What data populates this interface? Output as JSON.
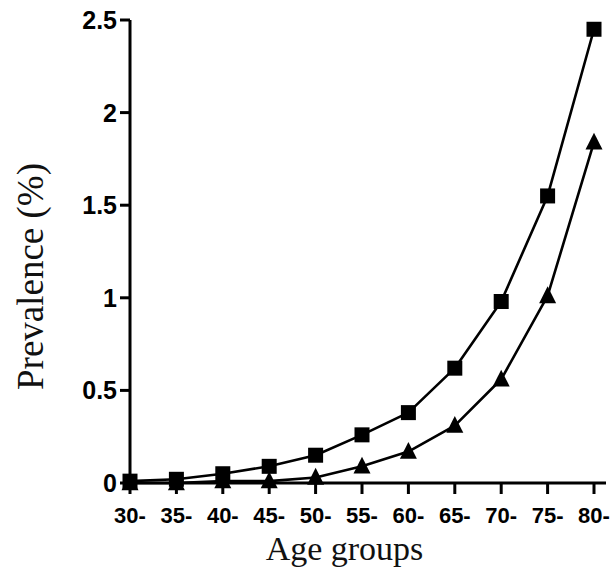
{
  "chart_data": {
    "type": "line",
    "title": "",
    "subtitle": "",
    "xlabel": "Age groups",
    "ylabel": "Prevalence (%)",
    "categories": [
      "30-",
      "35-",
      "40-",
      "45-",
      "50-",
      "55-",
      "60-",
      "65-",
      "70-",
      "75-",
      "80-"
    ],
    "series": [
      {
        "name": "series-squares",
        "marker": "square",
        "color": "#000000",
        "values": [
          0.01,
          0.02,
          0.05,
          0.09,
          0.15,
          0.26,
          0.38,
          0.62,
          0.98,
          1.55,
          2.45
        ]
      },
      {
        "name": "series-triangles",
        "marker": "triangle",
        "color": "#000000",
        "values": [
          0.0,
          0.0,
          0.01,
          0.01,
          0.03,
          0.09,
          0.17,
          0.31,
          0.56,
          1.01,
          1.84
        ]
      }
    ],
    "ylim": [
      0,
      2.5
    ],
    "yticks": [
      0,
      0.5,
      1,
      1.5,
      2,
      2.5
    ],
    "ytick_labels": [
      "0",
      "0.5",
      "1",
      "1.5",
      "2",
      "2.5"
    ],
    "xtick_labels": [
      "30-",
      "35-",
      "40-",
      "45-",
      "50-",
      "55-",
      "60-",
      "65-",
      "70-",
      "75-",
      "80-"
    ],
    "grid": false,
    "legend": null,
    "legend_position": "none",
    "annotations": [],
    "background_color": "#ffffff",
    "axis_color": "#000000"
  }
}
